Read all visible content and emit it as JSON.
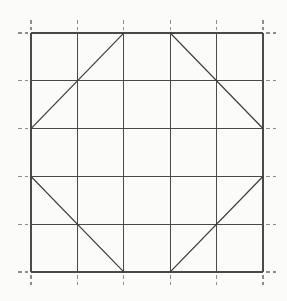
{
  "figure": {
    "title": "Octagon inscribed in a 5 by 5 square grid",
    "type": "geometric-line-diagram",
    "background_color": "#fbfbfa",
    "grid_line_color": "#4a4a4a",
    "tick_color": "#8d8d8d",
    "diagonal_color": "#3d3d3d",
    "canvas": {
      "width": 287,
      "height": 301
    }
  },
  "grid": {
    "columns": 5,
    "rows": 5,
    "vertical_line_count": 6,
    "horizontal_line_count": 6,
    "origin_x": 31,
    "origin_y": 33,
    "cell_width": 46.4,
    "cell_height": 47.8,
    "x_positions": [
      31,
      77.4,
      123.8,
      170.2,
      216.6,
      263
    ],
    "y_positions": [
      33,
      80.8,
      128.6,
      176.4,
      224.2,
      272
    ],
    "style": "solid",
    "tick_style": "dashed",
    "tick_length": 10,
    "tick_gap": 3,
    "tick_sides": [
      "top",
      "bottom",
      "left",
      "right"
    ]
  },
  "shape": {
    "name": "octagon",
    "description": "Four corner-cutting diagonals each spanning two grid cells, forming an octagon inscribed in the 5 by 5 grid",
    "diagonal_count": 4,
    "diagonals": [
      {
        "name": "top-left-diagonal",
        "from_cell": [
          0,
          2
        ],
        "to_cell": [
          2,
          0
        ],
        "x1": 31,
        "y1": 128.6,
        "x2": 123.8,
        "y2": 33
      },
      {
        "name": "top-right-diagonal",
        "from_cell": [
          3,
          0
        ],
        "to_cell": [
          5,
          2
        ],
        "x1": 170.2,
        "y1": 33,
        "x2": 263,
        "y2": 128.6
      },
      {
        "name": "bottom-left-diagonal",
        "from_cell": [
          0,
          3
        ],
        "to_cell": [
          2,
          5
        ],
        "x1": 31,
        "y1": 176.4,
        "x2": 123.8,
        "y2": 272
      },
      {
        "name": "bottom-right-diagonal",
        "from_cell": [
          3,
          5
        ],
        "to_cell": [
          5,
          3
        ],
        "x1": 170.2,
        "y1": 272,
        "x2": 263,
        "y2": 176.4
      }
    ]
  }
}
